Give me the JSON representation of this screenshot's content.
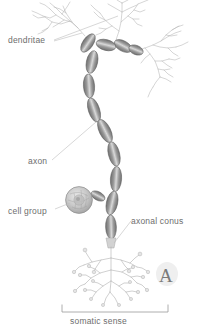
{
  "figure": {
    "panel_letter": "A",
    "caption": "somatic sense",
    "background_color": "#ffffff",
    "ink_color": "#6e6e6e",
    "myelin_color": "#8a8a8a",
    "label_color": "#6e6e6e"
  },
  "labels": {
    "dendritae": "dendritae",
    "axon": "axon",
    "cell_group": "cell group",
    "axonal_conus": "axonal conus",
    "somatic_sense": "somatic sense"
  },
  "structures": [
    {
      "name": "dendritic-tree-left",
      "label": "dendritae"
    },
    {
      "name": "dendritic-tree-top",
      "label": "dendritae"
    },
    {
      "name": "dendritic-tree-right",
      "label": "dendritae"
    },
    {
      "name": "myelinated-axon",
      "label": "axon"
    },
    {
      "name": "cell-body",
      "label": "cell group"
    },
    {
      "name": "axonal-conus",
      "label": "axonal conus"
    },
    {
      "name": "terminal-arbor",
      "label": "somatic sense"
    }
  ],
  "scale_bracket": {
    "label": "somatic sense",
    "x_start": 62,
    "x_end": 168
  }
}
